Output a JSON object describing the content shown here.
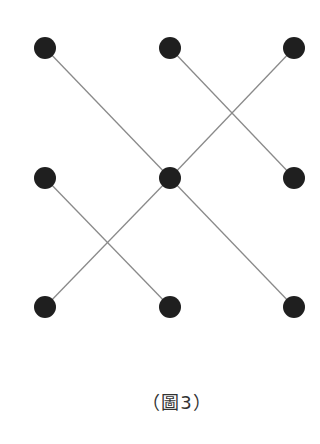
{
  "diagram": {
    "caption": "（圖3）",
    "dot_color": "#1f1f1f",
    "line_color": "#8a8a8a",
    "dot_radius": 11,
    "nodes": [
      {
        "id": "top-left",
        "x": 45,
        "y": 48
      },
      {
        "id": "top-middle",
        "x": 170,
        "y": 48
      },
      {
        "id": "top-right",
        "x": 294,
        "y": 48
      },
      {
        "id": "middle-left",
        "x": 45,
        "y": 178
      },
      {
        "id": "center",
        "x": 170,
        "y": 178
      },
      {
        "id": "middle-right",
        "x": 294,
        "y": 178
      },
      {
        "id": "bottom-left",
        "x": 45,
        "y": 307
      },
      {
        "id": "bottom-middle",
        "x": 170,
        "y": 307
      },
      {
        "id": "bottom-right",
        "x": 294,
        "y": 307
      }
    ],
    "edges": [
      {
        "from": "top-left",
        "to": "center"
      },
      {
        "from": "center",
        "to": "bottom-right"
      },
      {
        "from": "top-right",
        "to": "center"
      },
      {
        "from": "center",
        "to": "bottom-left"
      },
      {
        "from": "top-middle",
        "to": "middle-right"
      },
      {
        "from": "middle-left",
        "to": "bottom-middle"
      }
    ]
  }
}
